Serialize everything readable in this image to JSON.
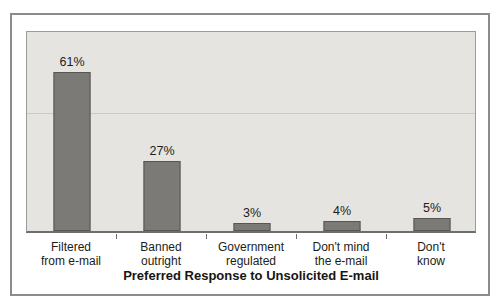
{
  "chart_data": {
    "type": "bar",
    "title": "Preferred Response to Unsolicited E-mail",
    "categories": [
      "Filtered from e-mail",
      "Banned outright",
      "Government regulated",
      "Don't mind the e-mail",
      "Don't know"
    ],
    "category_lines": [
      [
        "Filtered",
        "from e-mail"
      ],
      [
        "Banned",
        "outright"
      ],
      [
        "Government",
        "regulated"
      ],
      [
        "Don't mind",
        "the e-mail"
      ],
      [
        "Don't",
        "know"
      ]
    ],
    "values": [
      61,
      27,
      3,
      4,
      5
    ],
    "value_labels": [
      "61%",
      "27%",
      "3%",
      "4%",
      "5%"
    ],
    "xlabel": "",
    "ylabel": "",
    "ylim": [
      0,
      77
    ],
    "gridline_value": 46,
    "legend": "none",
    "colors": {
      "bar_fill": "#7b7a77",
      "bar_border": "#575653",
      "plot_background": "#e5e4e1",
      "plot_border": "#9c9b98",
      "axis_line": "#6e6d6a",
      "gridline": "#c9c8c5",
      "frame_border": "#8d8c8a",
      "text": "#1d1c19"
    }
  }
}
